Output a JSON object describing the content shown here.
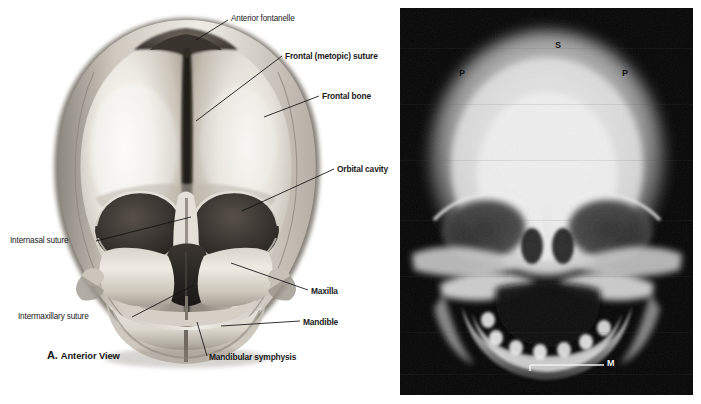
{
  "figure": {
    "panels": [
      {
        "id": "A",
        "type": "anatomical-illustration",
        "subject": "Neonatal skull, anterior view",
        "caption_letter": "A.",
        "caption_text": "Anterior View",
        "labels": [
          {
            "name": "anterior-fontanelle",
            "text": "Anterior fontanelle",
            "weight": "plain",
            "x": 231,
            "y": 14,
            "anchor": "left"
          },
          {
            "name": "frontal-metopic-suture",
            "text": "Frontal (metopic) suture",
            "weight": "bold",
            "x": 285,
            "y": 51,
            "anchor": "left"
          },
          {
            "name": "frontal-bone",
            "text": "Frontal bone",
            "weight": "bold",
            "x": 322,
            "y": 91,
            "anchor": "left"
          },
          {
            "name": "orbital-cavity",
            "text": "Orbital cavity",
            "weight": "bold",
            "x": 337,
            "y": 164,
            "anchor": "left"
          },
          {
            "name": "internasal-suture",
            "text": "Internasal suture",
            "weight": "plain",
            "x": 10,
            "y": 236,
            "anchor": "left"
          },
          {
            "name": "intermaxillary-suture",
            "text": "Intermaxillary suture",
            "weight": "plain",
            "x": 18,
            "y": 312,
            "anchor": "left"
          },
          {
            "name": "maxilla",
            "text": "Maxilla",
            "weight": "bold",
            "x": 311,
            "y": 286,
            "anchor": "left"
          },
          {
            "name": "mandible",
            "text": "Mandible",
            "weight": "bold",
            "x": 303,
            "y": 317,
            "anchor": "left"
          },
          {
            "name": "mandibular-symphysis",
            "text": "Mandibular symphysis",
            "weight": "bold",
            "x": 209,
            "y": 352,
            "anchor": "left"
          }
        ]
      },
      {
        "id": "B",
        "type": "radiograph",
        "subject": "Neonatal skull radiograph, anteroposterior projection",
        "labels": [
          {
            "name": "xray-label-sagittal-suture",
            "text": "S",
            "x": 555,
            "y": 40,
            "color": "dark"
          },
          {
            "name": "xray-label-parietal-left",
            "text": "P",
            "x": 459,
            "y": 68,
            "color": "dark"
          },
          {
            "name": "xray-label-parietal-right",
            "text": "P",
            "x": 622,
            "y": 68,
            "color": "dark"
          },
          {
            "name": "xray-label-mandible",
            "text": "M",
            "x": 607,
            "y": 361,
            "color": "light"
          }
        ]
      }
    ]
  },
  "colors": {
    "page_background": "#ffffff",
    "label_text": "#1a1a1a",
    "leader_line": "#111111",
    "xray_background": "#050505",
    "xray_leader_line": "#f0f0f0",
    "bone_light": "#f2efe9",
    "bone_mid": "#b8b2a8",
    "bone_shadow": "#6b6660",
    "cavity_dark": "#2b2722"
  }
}
